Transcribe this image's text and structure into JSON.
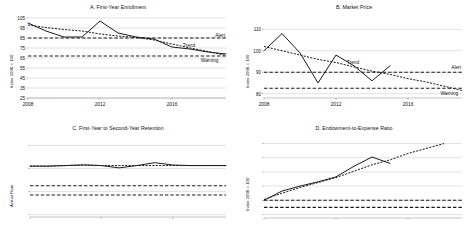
{
  "figure": {
    "panel_count": 4,
    "colors": {
      "actual": "#1a1a1a",
      "trend": "#1a1a1a",
      "alert": "#1a1a1a",
      "warning": "#1a1a1a",
      "gridline": "#c9c9c9",
      "background": "#ffffff"
    },
    "annotation_labels": {
      "trend": "Trend",
      "alert": "Alert",
      "warning": "Warning"
    }
  },
  "chart_data": [
    {
      "id": "panel-a",
      "type": "line",
      "title": "A. First-Year Enrollment",
      "xlabel": "",
      "ylabel": "Index 2008 = 100",
      "xlim": [
        2008,
        2019
      ],
      "ylim": [
        25,
        105
      ],
      "yticks": [
        25,
        35,
        45,
        55,
        65,
        75,
        85,
        95,
        105
      ],
      "ytick_labels": [
        "25",
        "35",
        "45",
        "55",
        "65",
        "75",
        "85",
        "95",
        "105"
      ],
      "xticks": [
        2008,
        2012,
        2016
      ],
      "xtick_labels": [
        "2008",
        "2012",
        "2016"
      ],
      "grid": true,
      "legend_position": "inline-right",
      "x": [
        2008,
        2009,
        2010,
        2011,
        2012,
        2013,
        2014,
        2015,
        2016,
        2017,
        2018,
        2019
      ],
      "series": [
        {
          "name": "Actual",
          "style": "solid",
          "values": [
            100,
            92,
            86,
            86,
            102,
            90,
            86,
            84,
            76,
            74,
            71,
            69
          ]
        },
        {
          "name": "Trend",
          "style": "dotted",
          "values": [
            98,
            95.5,
            93.5,
            92,
            89,
            87,
            85.5,
            83,
            79,
            75,
            71.5,
            67.5
          ]
        },
        {
          "name": "Alert",
          "style": "dashed",
          "values": [
            85,
            85,
            85,
            85,
            85,
            85,
            85,
            85,
            85,
            85,
            85,
            85
          ]
        },
        {
          "name": "Warning",
          "style": "dashed",
          "values": [
            67,
            67,
            67,
            67,
            67,
            67,
            67,
            67,
            67,
            67,
            67,
            67
          ]
        }
      ],
      "annotations": [
        {
          "text": "Alert",
          "x": 2018.4,
          "y": 87.5
        },
        {
          "text": "Trend",
          "x": 2016.6,
          "y": 77.5
        },
        {
          "text": "Warning",
          "x": 2017.6,
          "y": 62.5
        }
      ]
    },
    {
      "id": "panel-b",
      "type": "line",
      "title": "B. Market Price",
      "xlabel": "",
      "ylabel": "Index 2008 = 100",
      "xlim": [
        2008,
        2019
      ],
      "ylim": [
        78,
        112
      ],
      "yticks": [
        80,
        90,
        100,
        110
      ],
      "ytick_labels": [
        "80",
        "90",
        "100",
        "110"
      ],
      "xticks": [
        2008,
        2012,
        2016
      ],
      "xtick_labels": [
        "2008",
        "2012",
        "2016"
      ],
      "grid": true,
      "legend_position": "inline-right",
      "x": [
        2008,
        2009,
        2010,
        2011,
        2012,
        2013,
        2014,
        2015
      ],
      "series": [
        {
          "name": "Actual",
          "style": "solid",
          "values": [
            100,
            108,
            99,
            85,
            98,
            93,
            86,
            93
          ]
        },
        {
          "name": "Trend",
          "style": "dotted",
          "values": [
            102,
            100,
            98,
            96,
            94.5,
            92.5,
            90.5,
            89
          ]
        },
        {
          "name": "Alert",
          "style": "dashed",
          "values": [
            90,
            90,
            90,
            90,
            90,
            90,
            90,
            90
          ]
        },
        {
          "name": "Warning",
          "style": "dashed",
          "values": [
            82.5,
            82.5,
            82.5,
            82.5,
            82.5,
            82.5,
            82.5,
            82.5
          ]
        }
      ],
      "trend_extension": {
        "x": [
          2015,
          2016,
          2017,
          2018,
          2019
        ],
        "values": [
          89,
          87,
          85.5,
          83.5,
          81.5
        ]
      },
      "annotations": [
        {
          "text": "Trend",
          "x": 2012.6,
          "y": 94.2
        },
        {
          "text": "Alert",
          "x": 2018.4,
          "y": 92.0
        },
        {
          "text": "Warning",
          "x": 2017.8,
          "y": 79.8
        }
      ]
    },
    {
      "id": "panel-c",
      "type": "line",
      "title": "C. First-Year to Second-Year Retention",
      "xlabel": "",
      "ylabel": "Actual Rate",
      "xlim": [
        2008,
        2019
      ],
      "ylim": [
        38,
        102
      ],
      "yticks": [
        40,
        60,
        80,
        100
      ],
      "ytick_labels": [
        "40%",
        "60%",
        "80%",
        "100%"
      ],
      "xticks": [
        2008,
        2012,
        2016
      ],
      "xtick_labels": [
        "2008",
        "2012",
        "2016"
      ],
      "grid": true,
      "legend_position": "inline-right",
      "x": [
        2008,
        2009,
        2010,
        2011,
        2012,
        2013,
        2014,
        2015,
        2016,
        2017,
        2018,
        2019
      ],
      "series": [
        {
          "name": "Actual",
          "style": "solid",
          "values": [
            82,
            82,
            82.5,
            83,
            82.5,
            80.5,
            82.5,
            85,
            83,
            82.5,
            82.5,
            82.5
          ]
        },
        {
          "name": "Trend",
          "style": "dotted",
          "values": [
            82,
            82,
            82.5,
            83,
            82.5,
            82.5,
            82.5,
            82.5,
            82.5,
            82.5,
            82.5,
            82.5
          ]
        },
        {
          "name": "Alert",
          "style": "dashed",
          "values": [
            65,
            65,
            65,
            65,
            65,
            65,
            65,
            65,
            65,
            65,
            65,
            65
          ]
        },
        {
          "name": "Warning",
          "style": "dashed",
          "values": [
            57,
            57,
            57,
            57,
            57,
            57,
            57,
            57,
            57,
            57,
            57,
            57
          ]
        }
      ],
      "annotations": [
        {
          "text": "Trend",
          "x": 2017.4,
          "y": 87.5
        },
        {
          "text": "Alert",
          "x": 2018.3,
          "y": 68.5
        },
        {
          "text": "Warning",
          "x": 2017.6,
          "y": 52.5
        }
      ]
    },
    {
      "id": "panel-d",
      "type": "line",
      "title": "D. Endowment-to-Expense Ratio",
      "xlabel": "",
      "ylabel": "Index 2008 = 100",
      "xlim": [
        2008,
        2019
      ],
      "ylim": [
        75,
        185
      ],
      "yticks": [
        80,
        100,
        120,
        140,
        160,
        180
      ],
      "ytick_labels": [
        "80",
        "100",
        "120",
        "140",
        "160",
        "180"
      ],
      "xticks": [
        2008,
        2012,
        2016
      ],
      "xtick_labels": [
        "2008",
        "2012",
        "2016"
      ],
      "grid": true,
      "legend_position": "inline-right",
      "x": [
        2008,
        2009,
        2010,
        2011,
        2012,
        2013,
        2014,
        2015
      ],
      "series": [
        {
          "name": "Actual",
          "style": "solid",
          "values": [
            100,
            113,
            120,
            126,
            133,
            148,
            161,
            152
          ]
        },
        {
          "name": "Trend",
          "style": "dotted",
          "values": [
            101,
            110,
            118,
            125,
            132,
            141,
            150,
            157
          ]
        },
        {
          "name": "Alert",
          "style": "dashed",
          "values": [
            100,
            100,
            100,
            100,
            100,
            100,
            100,
            100
          ]
        },
        {
          "name": "Warning",
          "style": "dashed",
          "values": [
            90,
            90,
            90,
            90,
            90,
            90,
            90,
            90
          ]
        }
      ],
      "trend_extension": {
        "x": [
          2015,
          2016,
          2017,
          2018
        ],
        "values": [
          157,
          166,
          173,
          180
        ]
      },
      "annotations": [
        {
          "text": "Trend",
          "x": 2016.5,
          "y": 163
        },
        {
          "text": "Alert",
          "x": 2018.4,
          "y": 104
        },
        {
          "text": "Warning",
          "x": 2017.6,
          "y": 84
        }
      ]
    }
  ]
}
